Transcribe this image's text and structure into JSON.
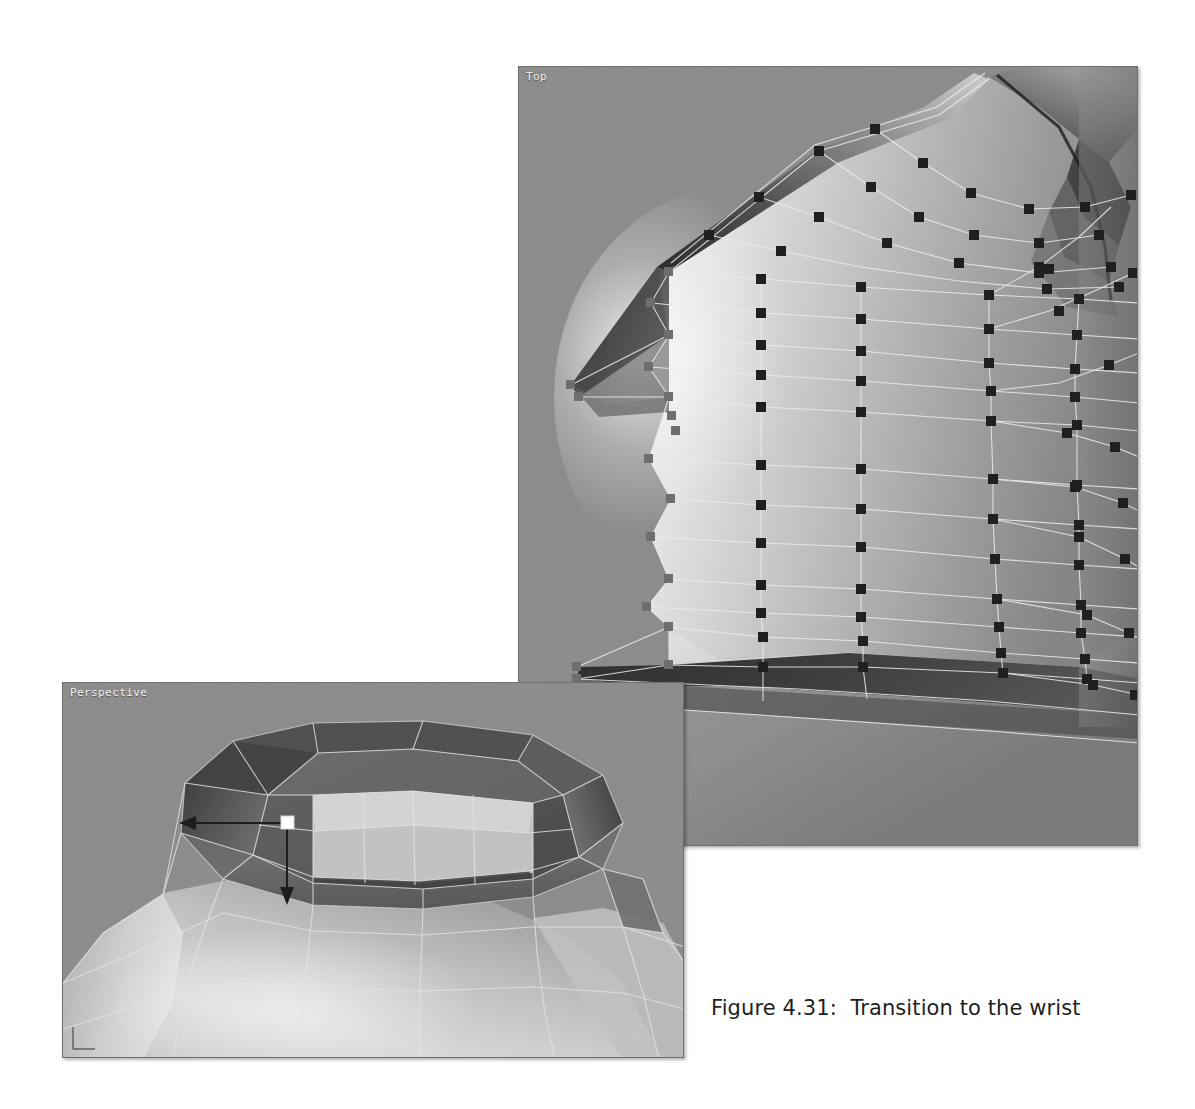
{
  "page": {
    "background_color": "#ffffff",
    "width": 1195,
    "height": 1109
  },
  "figure": {
    "caption": "Figure 4.31:  Transition to the wrist",
    "caption_color": "#231f20"
  },
  "viewports": [
    {
      "id": "top",
      "label": "Top",
      "kind": "orthographic",
      "background_color": "#8c8c8c",
      "wireframe_color": "#e8e8e8",
      "vertex_color": "#1d1d1d",
      "selected_vertex_color": "#8e8e8e",
      "x": 518,
      "y": 66,
      "width": 620,
      "height": 780
    },
    {
      "id": "perspective",
      "label": "Perspective",
      "kind": "perspective",
      "background_color": "#8c8c8c",
      "wireframe_color": "#e4e4e4",
      "x": 62,
      "y": 682,
      "width": 622,
      "height": 376,
      "manipulator": {
        "name": "move-manipulator",
        "center_handle_color": "#ffffff",
        "axis_color": "#1a1a1a",
        "arrows": [
          "left",
          "down"
        ]
      },
      "axis_gizmo": {
        "name": "axis-indicator",
        "color": "#5a5a5a"
      }
    }
  ],
  "colors": {
    "viewport_gray": "#8c8c8c",
    "mesh_light": "#d8d8d8",
    "mesh_mid": "#9a9a9a",
    "mesh_dark": "#4a4a4a",
    "mesh_darkest": "#242424",
    "wire": "#ededed",
    "vertex": "#1d1d1d",
    "border": "#6f6f6f",
    "caption": "#231f20"
  }
}
